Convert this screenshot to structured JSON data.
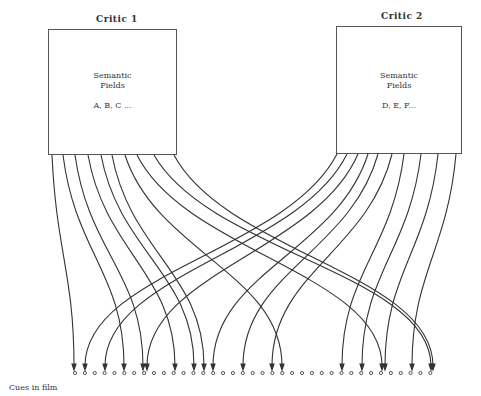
{
  "critics": [
    {
      "title": "Critic 1",
      "box_line1": "Semantic",
      "box_line2": "Fields",
      "fields": "A, B, C ..."
    },
    {
      "title": "Critic 2",
      "box_line1": "Semantic",
      "box_line2": "Fields",
      "fields": "D, E, F..."
    }
  ],
  "cues_label": "Cues in film",
  "cue_count": 37,
  "arrows": {
    "critic1_targets": [
      74,
      124,
      143,
      175,
      194,
      204,
      282,
      382,
      431,
      433
    ],
    "critic2_targets": [
      85,
      105,
      147,
      213,
      243,
      272,
      342,
      362,
      385,
      412
    ]
  }
}
